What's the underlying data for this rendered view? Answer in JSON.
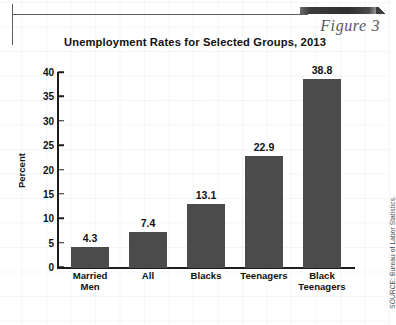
{
  "figure": {
    "label": "Figure 3"
  },
  "header": {
    "title": "Unemployment Rates for Selected Groups, 2013"
  },
  "source": {
    "note": "SOURCE: Bureau of Labor Statistics."
  },
  "axis": {
    "y_title": "Percent",
    "y_ticks": [
      "0",
      "5",
      "10",
      "15",
      "20",
      "25",
      "30",
      "35",
      "40"
    ]
  },
  "chart_data": {
    "type": "bar",
    "title": "Unemployment Rates for Selected Groups, 2013",
    "xlabel": "",
    "ylabel": "Percent",
    "ylim": [
      0,
      40
    ],
    "ytick_step": 5,
    "grid": false,
    "legend": "none",
    "bar_color": "#4b4b4b",
    "categories": [
      "Married Men",
      "All",
      "Blacks",
      "Teenagers",
      "Black Teenagers"
    ],
    "category_lines": [
      [
        "Married",
        "Men"
      ],
      [
        "All"
      ],
      [
        "Blacks"
      ],
      [
        "Teenagers"
      ],
      [
        "Black",
        "Teenagers"
      ]
    ],
    "values": [
      4.3,
      7.4,
      13.1,
      22.9,
      38.8
    ],
    "value_labels": [
      "4.3",
      "7.4",
      "13.1",
      "22.9",
      "38.8"
    ]
  }
}
